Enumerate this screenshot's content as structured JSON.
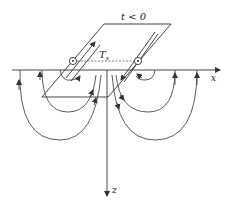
{
  "diagram": {
    "type": "transient electromagnetic loop source with eddy current field lines",
    "time_label": "t < 0",
    "transmitter_label": "T",
    "transmitter_subscript": "x",
    "axes": {
      "x_label": "x",
      "z_label": "z"
    },
    "current_markers": {
      "left": "⊙",
      "right": "⊙"
    },
    "colors": {
      "line": "#333333",
      "background": "#ffffff"
    }
  }
}
